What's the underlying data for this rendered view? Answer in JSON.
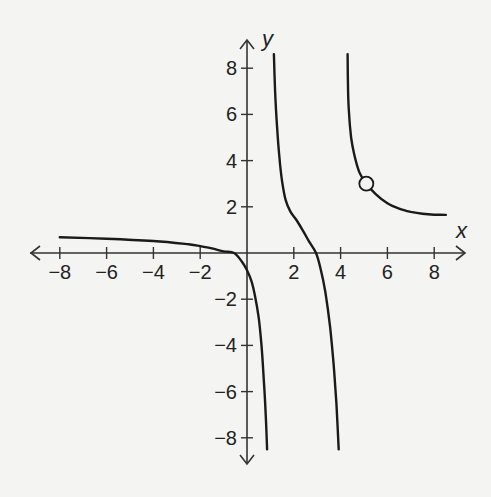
{
  "chart_data": {
    "type": "line",
    "title": "",
    "xlabel": "x",
    "ylabel": "y",
    "xlim": [
      -8.8,
      9.2
    ],
    "ylim": [
      -9.2,
      9.2
    ],
    "grid": false,
    "x_ticks": [
      -8,
      -6,
      -4,
      -2,
      2,
      4,
      6,
      8
    ],
    "y_ticks": [
      8,
      6,
      4,
      2,
      -2,
      -4,
      -6,
      -8
    ],
    "x_tick_labels": [
      "−8",
      "−6",
      "−4",
      "−2",
      "2",
      "4",
      "6",
      "8"
    ],
    "y_tick_labels": [
      "8",
      "6",
      "4",
      "2",
      "−2",
      "−4",
      "−6",
      "−8"
    ],
    "series": [
      {
        "name": "left-branch",
        "points": [
          [
            -8,
            0.68
          ],
          [
            -6,
            0.62
          ],
          [
            -4,
            0.52
          ],
          [
            -2.5,
            0.38
          ],
          [
            -2,
            0.3
          ],
          [
            -1.5,
            0.2
          ],
          [
            -1,
            0.07
          ],
          [
            -0.55,
            0
          ],
          [
            -0.2,
            -0.4
          ],
          [
            0,
            -0.75
          ],
          [
            0.2,
            -1.25
          ],
          [
            0.35,
            -1.9
          ],
          [
            0.5,
            -2.8
          ],
          [
            0.62,
            -4
          ],
          [
            0.72,
            -5.5
          ],
          [
            0.8,
            -7
          ],
          [
            0.86,
            -8.5
          ]
        ]
      },
      {
        "name": "middle-branch",
        "points": [
          [
            1.15,
            8.6
          ],
          [
            1.2,
            7
          ],
          [
            1.28,
            5.5
          ],
          [
            1.38,
            4.2
          ],
          [
            1.5,
            3.1
          ],
          [
            1.65,
            2.3
          ],
          [
            1.85,
            1.8
          ],
          [
            2.1,
            1.45
          ],
          [
            2.4,
            0.95
          ],
          [
            2.65,
            0.5
          ],
          [
            2.95,
            0
          ],
          [
            3.15,
            -0.7
          ],
          [
            3.35,
            -1.7
          ],
          [
            3.55,
            -3.2
          ],
          [
            3.7,
            -4.8
          ],
          [
            3.82,
            -6.5
          ],
          [
            3.92,
            -8.5
          ]
        ]
      },
      {
        "name": "upper-branch",
        "points": [
          [
            4.3,
            8.6
          ],
          [
            4.31,
            7.5
          ],
          [
            4.35,
            6.2
          ],
          [
            4.45,
            5
          ],
          [
            4.6,
            4.2
          ],
          [
            4.8,
            3.5
          ],
          [
            5.1,
            3.0
          ],
          [
            5.5,
            2.55
          ],
          [
            6,
            2.15
          ],
          [
            6.5,
            1.92
          ],
          [
            7,
            1.78
          ],
          [
            7.5,
            1.7
          ],
          [
            8,
            1.66
          ],
          [
            8.5,
            1.65
          ]
        ]
      }
    ],
    "annotations": [
      {
        "type": "open-circle",
        "x": 5.1,
        "y": 3.0,
        "label": "hole"
      }
    ],
    "asymptotes_vertical": [
      1,
      4
    ],
    "style": {
      "line_color": "#1a1a1a",
      "axis_color": "#333333",
      "background": "#f4f4f2"
    }
  }
}
